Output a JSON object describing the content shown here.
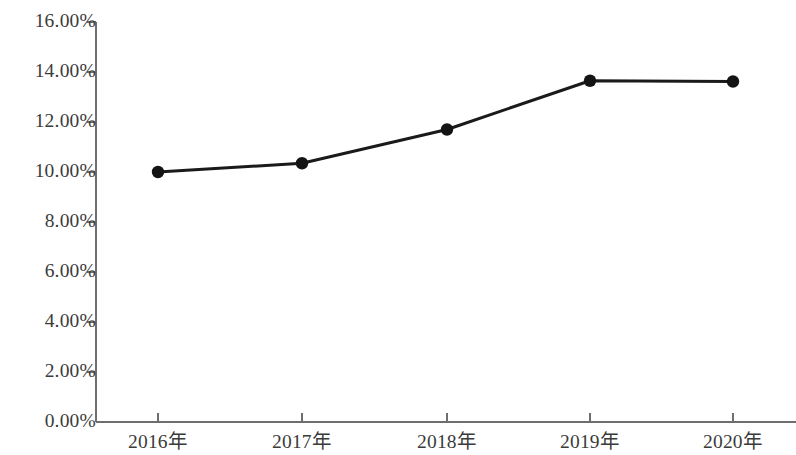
{
  "chart_data": {
    "type": "line",
    "title": "",
    "subtitle": "",
    "xlabel": "",
    "ylabel": "",
    "categories": [
      "2016年",
      "2017年",
      "2018年",
      "2019年",
      "2020年"
    ],
    "values": [
      10.0,
      10.35,
      11.7,
      13.65,
      13.62
    ],
    "value_labels": [
      "10.00%",
      "10.35%",
      "11.70%",
      "13.65%",
      "13.62%"
    ],
    "ylim": [
      0,
      16
    ],
    "ytick_labels": [
      "16.00%",
      "14.00%",
      "12.00%",
      "10.00%",
      "8.00%",
      "6.00%",
      "4.00%",
      "2.00%",
      "0.00%"
    ],
    "ytick_values": [
      16,
      14,
      12,
      10,
      8,
      6,
      4,
      2,
      0
    ],
    "grid": false,
    "legend": null,
    "legend_position": "none",
    "series": [
      {
        "name": "",
        "values": [
          10.0,
          10.35,
          11.7,
          13.65,
          13.62
        ],
        "line_color": "#1a1a1a",
        "marker_color": "#141414",
        "marker": "circle"
      }
    ],
    "axis_color": "#6e6e6e",
    "background_color": "#ffffff",
    "text_color": "#3b3b3b"
  }
}
